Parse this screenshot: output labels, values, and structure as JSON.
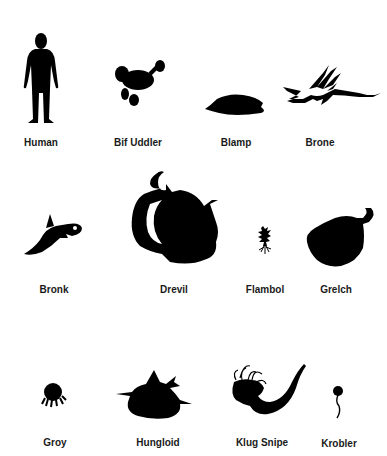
{
  "colors": {
    "silhouette": "#000000",
    "label": "#1a1a1a",
    "background": "#ffffff"
  },
  "creatures": [
    {
      "name": "Human"
    },
    {
      "name": "Bif Uddler"
    },
    {
      "name": "Blamp"
    },
    {
      "name": "Brone"
    },
    {
      "name": "Bronk"
    },
    {
      "name": "Drevil"
    },
    {
      "name": "Flambol"
    },
    {
      "name": "Grelch"
    },
    {
      "name": "Groy"
    },
    {
      "name": "Hungloid"
    },
    {
      "name": "Klug Snipe"
    },
    {
      "name": "Krobler"
    }
  ]
}
